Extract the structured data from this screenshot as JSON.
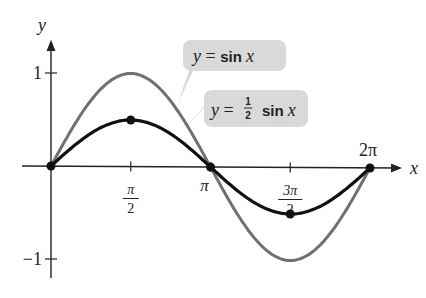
{
  "chart_data": {
    "type": "line",
    "title": "",
    "xlabel": "x",
    "ylabel": "y",
    "xlim": [
      0,
      6.2832
    ],
    "ylim": [
      -1,
      1
    ],
    "x_ticks": [
      {
        "value": 1.5708,
        "num": "π",
        "den": "2"
      },
      {
        "value": 3.1416,
        "label": "π"
      },
      {
        "value": 4.7124,
        "num": "3π",
        "den": "2"
      },
      {
        "value": 6.2832,
        "label": "2π"
      }
    ],
    "y_ticks": [
      {
        "value": 1,
        "label": "1"
      },
      {
        "value": -1,
        "label": "−1"
      }
    ],
    "series": [
      {
        "name": "y = sin x",
        "amplitude": 1,
        "color": "#707070",
        "label_parts": {
          "lhs": "y",
          "eq": " = ",
          "fn": "sin",
          "var": "x"
        }
      },
      {
        "name": "y = ½ sin x",
        "amplitude": 0.5,
        "color": "#111111",
        "label_parts": {
          "lhs": "y",
          "eq": " = ",
          "num": "1",
          "den": "2",
          "fn": "sin",
          "var": "x"
        },
        "points": [
          [
            0,
            0
          ],
          [
            1.5708,
            0.5
          ],
          [
            3.1416,
            0
          ],
          [
            4.7124,
            -0.5
          ],
          [
            6.2832,
            0
          ]
        ]
      }
    ],
    "grid": false
  }
}
